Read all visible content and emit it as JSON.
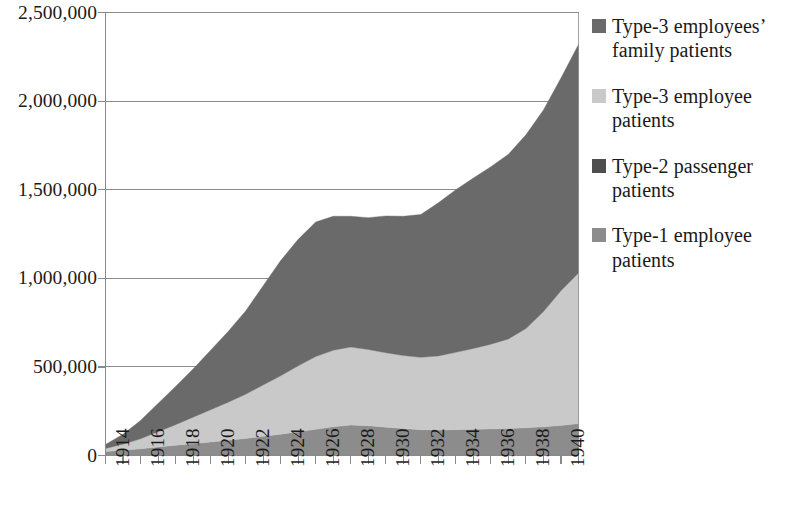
{
  "chart_data": {
    "type": "area",
    "stacked": true,
    "title": "",
    "xlabel": "",
    "ylabel": "",
    "xlim": [
      1914,
      1941
    ],
    "ylim": [
      0,
      2500000
    ],
    "grid": true,
    "legend_position": "right",
    "x": [
      1914,
      1915,
      1916,
      1917,
      1918,
      1919,
      1920,
      1921,
      1922,
      1923,
      1924,
      1925,
      1926,
      1927,
      1928,
      1929,
      1930,
      1931,
      1932,
      1933,
      1934,
      1935,
      1936,
      1937,
      1938,
      1939,
      1940,
      1941
    ],
    "x_tick_labels": [
      "1914",
      "1916",
      "1918",
      "1920",
      "1922",
      "1924",
      "1926",
      "1928",
      "1930",
      "1932",
      "1934",
      "1936",
      "1938",
      "1940"
    ],
    "y_tick_labels": [
      "0",
      "500,000",
      "1,000,000",
      "1,500,000",
      "2,000,000",
      "2,500,000"
    ],
    "y_ticks": [
      0,
      500000,
      1000000,
      1500000,
      2000000,
      2500000
    ],
    "series": [
      {
        "name": "Type-1 employee patients",
        "color": "#8c8c8c",
        "values": [
          22000,
          30000,
          38000,
          48000,
          58000,
          66000,
          76000,
          86000,
          96000,
          108000,
          120000,
          134000,
          148000,
          162000,
          172000,
          168000,
          160000,
          152000,
          146000,
          144000,
          146000,
          148000,
          150000,
          152000,
          156000,
          162000,
          170000,
          180000
        ]
      },
      {
        "name": "Type-3 employee patients",
        "color": "#c9c9c9",
        "values": [
          18000,
          34000,
          56000,
          86000,
          116000,
          150000,
          182000,
          214000,
          250000,
          290000,
          330000,
          372000,
          410000,
          432000,
          440000,
          430000,
          420000,
          412000,
          408000,
          418000,
          436000,
          456000,
          478000,
          506000,
          560000,
          650000,
          760000,
          850000
        ]
      },
      {
        "name": "Type-2 passenger patients",
        "color": "#6a6a6a",
        "values": [
          22000,
          56000,
          104000,
          160000,
          216000,
          272000,
          336000,
          400000,
          470000,
          560000,
          650000,
          714000,
          760000,
          756000,
          738000,
          744000,
          772000,
          786000,
          806000,
          864000,
          918000,
          962000,
          1002000,
          1042000,
          1094000,
          1138000,
          1200000,
          1290000
        ]
      },
      {
        "name": "Type-3 employees' family patients",
        "color": "#6a6a6a",
        "values": [
          0,
          0,
          0,
          0,
          0,
          0,
          0,
          0,
          0,
          0,
          0,
          0,
          0,
          0,
          0,
          0,
          0,
          0,
          0,
          0,
          0,
          0,
          0,
          0,
          0,
          0,
          0,
          0
        ]
      }
    ],
    "totals": [
      62000,
      120000,
      198000,
      294000,
      390000,
      488000,
      594000,
      700000,
      816000,
      958000,
      1100000,
      1220000,
      1318000,
      1350000,
      1350000,
      1342000,
      1352000,
      1350000,
      1360000,
      1426000,
      1500000,
      1566000,
      1630000,
      1700000,
      1810000,
      1950000,
      2130000,
      2320000
    ]
  },
  "legend": {
    "items": [
      {
        "label": "Type-3 employees’ family patients",
        "color": "#6a6a6a",
        "swatch": "legend-swatch-type3-family"
      },
      {
        "label": "Type-3 employee patients",
        "color": "#c9c9c9",
        "swatch": "legend-swatch-type3-employee"
      },
      {
        "label": "Type-2 passenger patients",
        "color": "#4e4e4e",
        "swatch": "legend-swatch-type2-passenger"
      },
      {
        "label": "Type-1 employee patients",
        "color": "#8c8c8c",
        "swatch": "legend-swatch-type1-employee"
      }
    ]
  },
  "axes": {
    "y_labels": [
      "2,500,000",
      "2,000,000",
      "1,500,000",
      "1,000,000",
      "500,000",
      "0"
    ],
    "x_labels": [
      "1914",
      "1916",
      "1918",
      "1920",
      "1922",
      "1924",
      "1926",
      "1928",
      "1930",
      "1932",
      "1934",
      "1936",
      "1938",
      "1940"
    ]
  },
  "style": {
    "axis_color": "#8a8a8a",
    "text_color": "#1a1a1a",
    "background": "#ffffff"
  }
}
